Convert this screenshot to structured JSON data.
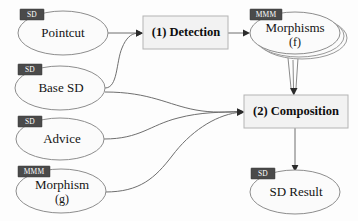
{
  "diagram": {
    "background_color": "#fdfdfd",
    "stereotype_tag_color": "#4a4a4a",
    "process_box_fill": "#f2f2f2",
    "node_fill": "#fbfbfb",
    "edge_color": "#6f6f6f",
    "nodes": [
      {
        "id": "pointcut",
        "shape": "ellipse",
        "tag": "SD",
        "label": "Pointcut",
        "sublabel": ""
      },
      {
        "id": "base-sd",
        "shape": "ellipse",
        "tag": "SD",
        "label": "Base SD",
        "sublabel": ""
      },
      {
        "id": "advice",
        "shape": "ellipse",
        "tag": "SD",
        "label": "Advice",
        "sublabel": ""
      },
      {
        "id": "morphism-g",
        "shape": "ellipse",
        "tag": "MMM",
        "label": "Morphism",
        "sublabel": "(g)"
      },
      {
        "id": "detection",
        "shape": "box",
        "tag": "",
        "label": "(1) Detection",
        "sublabel": ""
      },
      {
        "id": "morphisms-f",
        "shape": "ellipse-stack",
        "tag": "MMM",
        "label": "Morphisms",
        "sublabel": "(f)"
      },
      {
        "id": "composition",
        "shape": "box",
        "tag": "",
        "label": "(2) Composition",
        "sublabel": ""
      },
      {
        "id": "sd-result",
        "shape": "ellipse",
        "tag": "SD",
        "label": "SD Result",
        "sublabel": ""
      }
    ],
    "edges": [
      {
        "from": "pointcut",
        "to": "detection",
        "style": "arrow"
      },
      {
        "from": "base-sd",
        "to": "detection",
        "style": "arrow"
      },
      {
        "from": "detection",
        "to": "morphisms-f",
        "style": "arrow"
      },
      {
        "from": "morphisms-f",
        "to": "composition",
        "style": "triple-arrow"
      },
      {
        "from": "base-sd",
        "to": "composition",
        "style": "arrow"
      },
      {
        "from": "advice",
        "to": "composition",
        "style": "arrow"
      },
      {
        "from": "morphism-g",
        "to": "composition",
        "style": "arrow"
      },
      {
        "from": "composition",
        "to": "sd-result",
        "style": "arrow"
      }
    ]
  }
}
